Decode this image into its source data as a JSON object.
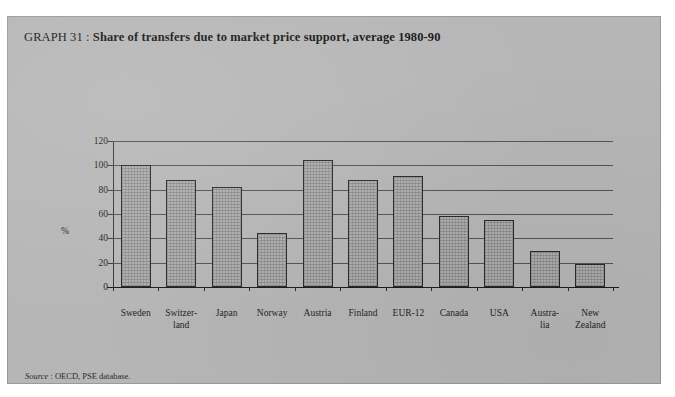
{
  "page": {
    "background_color": "#b6b6b6",
    "frame_color": "#9a9a9a"
  },
  "title": {
    "lead": "GRAPH 31",
    "separator": " : ",
    "bold": "Share of transfers due to market price support, average 1980-90",
    "full": "GRAPH 31 : Share of transfers due to market price support, average 1980-90"
  },
  "source": {
    "label": "Source",
    "text": " : OECD, PSE database."
  },
  "axis": {
    "y_unit_label": "%",
    "y_ticks": [
      "0",
      "20",
      "40",
      "60",
      "80",
      "100",
      "120"
    ]
  },
  "chart_data": {
    "type": "bar",
    "title": "Share of transfers due to market price support, average 1980-90",
    "xlabel": "",
    "ylabel": "%",
    "ylim": [
      0,
      120
    ],
    "yticks": [
      0,
      20,
      40,
      60,
      80,
      100,
      120
    ],
    "grid": true,
    "legend": "none",
    "bar_color": "#adadad",
    "bar_edge_color": "#2a2a2a",
    "categories": [
      "Sweden",
      "Switzer-land",
      "Japan",
      "Norway",
      "Austria",
      "Finland",
      "EUR-12",
      "Canada",
      "USA",
      "Austra-lia",
      "New Zealand"
    ],
    "category_lines": [
      [
        "Sweden"
      ],
      [
        "Switzer-",
        "land"
      ],
      [
        "Japan"
      ],
      [
        "Norway"
      ],
      [
        "Austria"
      ],
      [
        "Finland"
      ],
      [
        "EUR-12"
      ],
      [
        "Canada"
      ],
      [
        "USA"
      ],
      [
        "Austra-",
        "lia"
      ],
      [
        "New",
        "Zealand"
      ]
    ],
    "values": [
      100,
      88,
      82,
      44,
      104,
      88,
      91,
      58,
      55,
      30,
      19
    ]
  }
}
